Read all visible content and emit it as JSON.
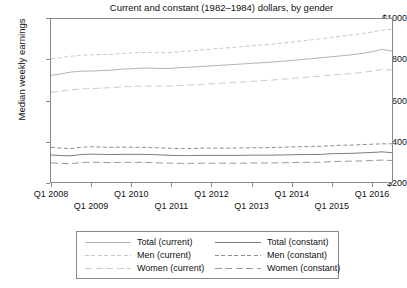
{
  "chart_data": {
    "type": "line",
    "title": "Current and constant (1982–1984) dollars, by gender",
    "xlabel": "",
    "ylabel": "Median weekly earnings",
    "ylim": [
      200,
      1000
    ],
    "yticks": [
      200,
      400,
      600,
      800,
      1000
    ],
    "ytick_labels": [
      "$200",
      "$400",
      "$600",
      "$800",
      "$1000"
    ],
    "grid": false,
    "legend_position": "below-plot",
    "x": [
      "Q1 2008",
      "Q2 2008",
      "Q3 2008",
      "Q4 2008",
      "Q1 2009",
      "Q2 2009",
      "Q3 2009",
      "Q4 2009",
      "Q1 2010",
      "Q2 2010",
      "Q3 2010",
      "Q4 2010",
      "Q1 2011",
      "Q2 2011",
      "Q3 2011",
      "Q4 2011",
      "Q1 2012",
      "Q2 2012",
      "Q3 2012",
      "Q4 2012",
      "Q1 2013",
      "Q2 2013",
      "Q3 2013",
      "Q4 2013",
      "Q1 2014",
      "Q2 2014",
      "Q3 2014",
      "Q4 2014",
      "Q1 2015",
      "Q2 2015",
      "Q3 2015",
      "Q4 2015",
      "Q1 2016",
      "Q2 2016",
      "Q3 2016"
    ],
    "xtick_labels": [
      "Q1 2008",
      "Q1 2009",
      "Q1 2010",
      "Q1 2011",
      "Q1 2012",
      "Q1 2013",
      "Q1 2014",
      "Q1 2015",
      "Q1 2016"
    ],
    "xtick_indices": [
      0,
      4,
      8,
      12,
      16,
      20,
      24,
      28,
      32
    ],
    "series": [
      {
        "name": "Total (current)",
        "style": "solid",
        "color": "#b4b4b4",
        "values": [
          722,
          729,
          738,
          742,
          743,
          745,
          747,
          752,
          754,
          757,
          757,
          755,
          756,
          760,
          762,
          765,
          768,
          771,
          774,
          777,
          780,
          783,
          786,
          790,
          794,
          799,
          803,
          808,
          812,
          817,
          822,
          828,
          836,
          848,
          840
        ]
      },
      {
        "name": "Men (current)",
        "style": "dash",
        "color": "#c8c8c8",
        "values": [
          802,
          808,
          815,
          820,
          821,
          823,
          824,
          828,
          830,
          833,
          833,
          832,
          833,
          837,
          841,
          845,
          849,
          853,
          857,
          861,
          865,
          869,
          873,
          878,
          883,
          889,
          894,
          900,
          906,
          912,
          918,
          925,
          932,
          941,
          945
        ]
      },
      {
        "name": "Women (current)",
        "style": "longdash",
        "color": "#cdcdcd",
        "values": [
          640,
          645,
          652,
          656,
          658,
          660,
          662,
          666,
          668,
          670,
          670,
          669,
          670,
          673,
          675,
          678,
          681,
          684,
          687,
          690,
          693,
          696,
          699,
          703,
          707,
          711,
          715,
          719,
          723,
          727,
          731,
          736,
          742,
          750,
          748
        ]
      },
      {
        "name": "Total (constant)",
        "style": "solid",
        "color": "#7d7d7d",
        "values": [
          336,
          333,
          332,
          338,
          340,
          339,
          338,
          339,
          339,
          339,
          338,
          336,
          334,
          333,
          333,
          334,
          334,
          334,
          334,
          334,
          335,
          335,
          335,
          336,
          337,
          338,
          338,
          339,
          342,
          343,
          344,
          346,
          348,
          351,
          347
        ]
      },
      {
        "name": "Men (constant)",
        "style": "dash",
        "color": "#8e8e8e",
        "values": [
          373,
          369,
          367,
          373,
          376,
          374,
          373,
          374,
          373,
          373,
          372,
          370,
          368,
          367,
          367,
          369,
          369,
          369,
          369,
          370,
          371,
          371,
          372,
          373,
          375,
          376,
          377,
          378,
          381,
          383,
          384,
          386,
          388,
          390,
          390
        ]
      },
      {
        "name": "Women (constant)",
        "style": "longdash",
        "color": "#9a9a9a",
        "values": [
          298,
          295,
          294,
          299,
          301,
          300,
          299,
          300,
          300,
          300,
          299,
          297,
          296,
          295,
          295,
          296,
          296,
          296,
          296,
          296,
          297,
          297,
          297,
          298,
          299,
          300,
          300,
          301,
          304,
          305,
          306,
          307,
          309,
          311,
          309
        ]
      }
    ]
  },
  "legend": {
    "columns": [
      {
        "items": [
          "Total (current)",
          "Men (current)",
          "Women (current)"
        ]
      },
      {
        "items": [
          "Total (constant)",
          "Men (constant)",
          "Women (constant)"
        ]
      }
    ]
  }
}
